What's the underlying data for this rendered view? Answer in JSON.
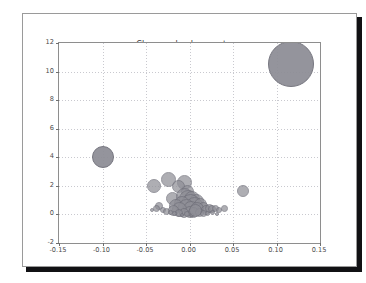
{
  "window": {
    "background_color": "#ffffff",
    "card_border_color": "#9a9a9a",
    "shadow_color": "#111114"
  },
  "chart_data": {
    "type": "scatter",
    "title": "Close and volume returns",
    "xlabel": "",
    "ylabel": "",
    "xlim": [
      -0.15,
      0.15
    ],
    "ylim": [
      -2,
      12
    ],
    "grid": true,
    "legend": "none",
    "marker": "bubble",
    "xticks": [
      "-0.15",
      "-0.10",
      "-0.05",
      "0.00",
      "0.05",
      "0.10",
      "0.15"
    ],
    "xtick_values": [
      -0.15,
      -0.1,
      -0.05,
      0.0,
      0.05,
      0.1,
      0.15
    ],
    "yticks": [
      "-2",
      "0",
      "2",
      "4",
      "6",
      "8",
      "10",
      "12"
    ],
    "ytick_values": [
      -2,
      0,
      2,
      4,
      6,
      8,
      10,
      12
    ],
    "bubble_fill": "#8f8f97",
    "bubble_edge": "#70707a",
    "points": [
      {
        "x": 0.117,
        "y": 10.55,
        "s": 23.0
      },
      {
        "x": -0.099,
        "y": 4.05,
        "s": 11.0
      },
      {
        "x": -0.024,
        "y": 2.42,
        "s": 7.5
      },
      {
        "x": -0.041,
        "y": 1.97,
        "s": 7.0
      },
      {
        "x": -0.006,
        "y": 2.23,
        "s": 7.5
      },
      {
        "x": -0.013,
        "y": 1.97,
        "s": 6.5
      },
      {
        "x": -0.002,
        "y": 1.58,
        "s": 6.5
      },
      {
        "x": 0.062,
        "y": 1.66,
        "s": 6.0
      },
      {
        "x": -0.02,
        "y": 1.13,
        "s": 6.5
      },
      {
        "x": -0.006,
        "y": 1.25,
        "s": 8.5
      },
      {
        "x": -0.002,
        "y": 1.05,
        "s": 9.0
      },
      {
        "x": 0.003,
        "y": 1.08,
        "s": 8.0
      },
      {
        "x": 0.008,
        "y": 0.92,
        "s": 7.5
      },
      {
        "x": 0.001,
        "y": 0.8,
        "s": 9.5
      },
      {
        "x": -0.009,
        "y": 0.72,
        "s": 8.0
      },
      {
        "x": -0.015,
        "y": 0.58,
        "s": 7.0
      },
      {
        "x": 0.006,
        "y": 0.66,
        "s": 8.5
      },
      {
        "x": 0.013,
        "y": 0.7,
        "s": 6.5
      },
      {
        "x": 0.016,
        "y": 0.52,
        "s": 5.5
      },
      {
        "x": -0.004,
        "y": 0.48,
        "s": 8.5
      },
      {
        "x": 0.002,
        "y": 0.4,
        "s": 8.0
      },
      {
        "x": 0.009,
        "y": 0.38,
        "s": 7.0
      },
      {
        "x": -0.011,
        "y": 0.34,
        "s": 7.5
      },
      {
        "x": -0.018,
        "y": 0.3,
        "s": 5.5
      },
      {
        "x": 0.019,
        "y": 0.3,
        "s": 5.0
      },
      {
        "x": 0.023,
        "y": 0.42,
        "s": 4.5
      },
      {
        "x": 0.026,
        "y": 0.36,
        "s": 4.0
      },
      {
        "x": 0.03,
        "y": 0.44,
        "s": 3.5
      },
      {
        "x": 0.034,
        "y": 0.3,
        "s": 3.0
      },
      {
        "x": 0.04,
        "y": 0.42,
        "s": 3.5
      },
      {
        "x": -0.035,
        "y": 0.58,
        "s": 4.0
      },
      {
        "x": -0.038,
        "y": 0.42,
        "s": 3.5
      },
      {
        "x": -0.03,
        "y": 0.33,
        "s": 3.0
      },
      {
        "x": -0.026,
        "y": 0.24,
        "s": 3.5
      },
      {
        "x": -0.022,
        "y": 0.16,
        "s": 2.5
      },
      {
        "x": 0.0,
        "y": 0.18,
        "s": 6.0
      },
      {
        "x": 0.005,
        "y": 0.14,
        "s": 5.5
      },
      {
        "x": -0.006,
        "y": 0.12,
        "s": 5.0
      },
      {
        "x": 0.011,
        "y": 0.16,
        "s": 4.5
      },
      {
        "x": -0.012,
        "y": 0.08,
        "s": 4.0
      },
      {
        "x": 0.016,
        "y": 0.08,
        "s": 3.5
      },
      {
        "x": -0.017,
        "y": 0.05,
        "s": 2.5
      },
      {
        "x": 0.021,
        "y": 0.05,
        "s": 2.5
      },
      {
        "x": 0.027,
        "y": 0.12,
        "s": 2.5
      },
      {
        "x": -0.003,
        "y": 0.02,
        "s": 3.0
      },
      {
        "x": 0.003,
        "y": -0.02,
        "s": 2.0
      },
      {
        "x": -0.009,
        "y": -0.04,
        "s": 2.0
      },
      {
        "x": 0.032,
        "y": 0.05,
        "s": 2.0
      },
      {
        "x": -0.043,
        "y": 0.3,
        "s": 2.0
      },
      {
        "x": 0.007,
        "y": 0.28,
        "s": 6.5
      }
    ]
  }
}
